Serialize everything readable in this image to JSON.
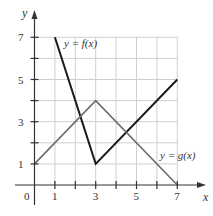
{
  "chart_data": {
    "type": "line",
    "title": "",
    "xlabel": "x",
    "ylabel": "y",
    "xlim": [
      0,
      7
    ],
    "ylim": [
      0,
      7
    ],
    "grid": true,
    "x_ticks": [
      1,
      2,
      3,
      4,
      5,
      6,
      7
    ],
    "x_tick_labels": [
      "0",
      "1",
      "3",
      "5",
      "7"
    ],
    "y_ticks": [
      1,
      2,
      3,
      4,
      5,
      6,
      7
    ],
    "y_tick_labels": [
      "1",
      "3",
      "5",
      "7"
    ],
    "series": [
      {
        "name": "y = f(x)",
        "color": "#1a1a1a",
        "points": [
          [
            1,
            7
          ],
          [
            3,
            1
          ],
          [
            7,
            5
          ]
        ]
      },
      {
        "name": "y = g(x)",
        "color": "#6b6b6b",
        "points": [
          [
            0,
            1
          ],
          [
            3,
            4
          ],
          [
            7,
            0
          ]
        ]
      }
    ],
    "annotations": [
      {
        "text": "y = f(x)",
        "near": [
          1.5,
          6.7
        ]
      },
      {
        "text": "y = g(x)",
        "near": [
          6.2,
          1.4
        ]
      }
    ]
  },
  "labels": {
    "x_axis": "x",
    "y_axis": "y",
    "origin": "0",
    "f_label": "y = f(x)",
    "g_label": "y = g(x)"
  }
}
